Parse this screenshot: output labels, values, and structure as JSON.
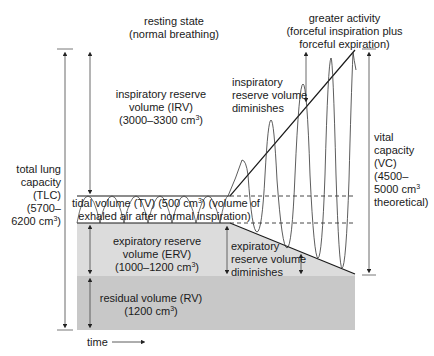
{
  "header": {
    "resting_title": "resting state",
    "resting_sub": "(normal breathing)",
    "activity_title": "greater activity",
    "activity_sub1": "(forceful inspiration plus",
    "activity_sub2": "forceful expiration)"
  },
  "labels": {
    "irv_line1": "inspiratory reserve",
    "irv_line2": "volume (IRV)",
    "irv_line3": "(3000–3300 cm",
    "irv_sup": "3",
    "irv_end": ")",
    "irv_dim1": "inspiratory",
    "irv_dim2": "reserve volume",
    "irv_dim3": "diminishes",
    "tlc1": "total lung",
    "tlc2": "capacity",
    "tlc3": "(TLC)",
    "tlc4": "(5700–",
    "tlc5": "6200 cm",
    "tlc_sup": "3",
    "tlc_end": ")",
    "tv_line1": "tidal volume (TV) (500 cm",
    "tv_sup": "3",
    "tv_line1_end": ") (volume of",
    "tv_line2": "exhaled air after normal inspiration)",
    "erv_line1": "expiratory reserve",
    "erv_line2": "volume (ERV)",
    "erv_line3": "(1000–1200 cm",
    "erv_sup": "3",
    "erv_end": ")",
    "erv_dim1": "expiratory",
    "erv_dim2": "reserve volume",
    "erv_dim3": "diminishes",
    "rv_line1": "residual volume (RV)",
    "rv_line2": "(1200 cm",
    "rv_sup": "3",
    "rv_end": ")",
    "vc1": "vital",
    "vc2": "capacity",
    "vc3": "(VC)",
    "vc4": "(4500–",
    "vc5": "5000 cm",
    "vc_sup": "3",
    "vc6": "theoretical)",
    "time": "time"
  },
  "colors": {
    "erv_fill": "#dcdcdc",
    "rv_fill": "#c6c6c6",
    "line": "#1a1a1a",
    "arrow": "#333333"
  }
}
